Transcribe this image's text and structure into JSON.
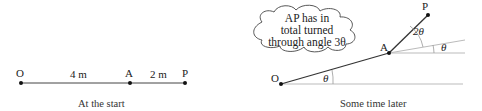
{
  "left_diagram": {
    "caption": "At the start",
    "points": {
      "O": "O",
      "A": "A",
      "P": "P"
    },
    "segments": {
      "OA": "4 m",
      "AP": "2 m"
    }
  },
  "right_diagram": {
    "caption": "Some time later",
    "points": {
      "O": "O",
      "A": "A",
      "P": "P"
    },
    "angles": {
      "at_O": "θ",
      "at_A_lower": "θ",
      "at_A_upper": "2θ"
    },
    "cloud": {
      "line1": "AP has in",
      "line2": "total turned",
      "line3": "through angle 3θ"
    }
  },
  "colors": {
    "line": "#333333",
    "guide": "#bbbbbb",
    "text": "#222222"
  }
}
